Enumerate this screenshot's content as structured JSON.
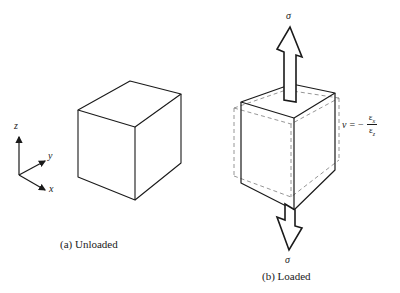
{
  "figure": {
    "type": "poisson-ratio-cube-diagram",
    "colors": {
      "stroke": "#1a1a1a",
      "dashed": "#8a8a8a",
      "background": "#ffffff"
    }
  },
  "axes": {
    "z_label": "z",
    "y_label": "y",
    "x_label": "x"
  },
  "panel_a": {
    "caption": "(a) Unloaded"
  },
  "panel_b": {
    "caption": "(b) Loaded",
    "top_load_label": "σ",
    "bottom_load_label": "σ",
    "formula": {
      "lhs": "ν",
      "equals": "=",
      "sign": "−",
      "numerator": "ε",
      "numerator_sub": "x",
      "denominator": "ε",
      "denominator_sub": "z"
    }
  }
}
